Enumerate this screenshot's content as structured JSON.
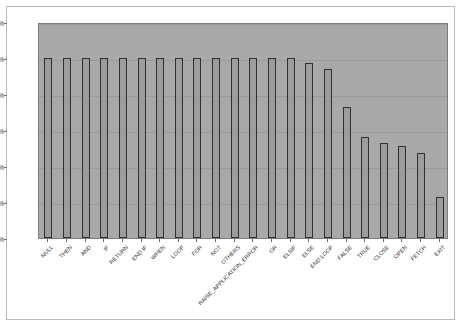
{
  "chart_data": {
    "type": "bar",
    "title": "",
    "subtitle": "",
    "xlabel": "",
    "ylabel": "",
    "ylim": [
      0,
      120
    ],
    "y_unit": "%",
    "grid": true,
    "legend": "none",
    "orientation": "vertical",
    "categories": [
      "NULL",
      "THEN",
      "AND",
      "IF",
      "RETURN",
      "END IF",
      "WHEN",
      "LOOP",
      "FOR",
      "NOT",
      "OTHERS",
      "RAISE_APPLICATION_ERROR",
      "OR",
      "ELSIF",
      "ELSE",
      "END LOOP",
      "FALSE",
      "TRUE",
      "CLOSE",
      "OPEN",
      "FETCH",
      "EXIT"
    ],
    "values": [
      100,
      100,
      100,
      100,
      100,
      100,
      100,
      100,
      100,
      100,
      100,
      100,
      100,
      100,
      97,
      94,
      73,
      56,
      53,
      51,
      47,
      23
    ],
    "yticks": [
      0,
      20,
      40,
      60,
      80,
      100,
      120
    ],
    "ytick_labels": [
      "0%",
      "20%",
      "40%",
      "60%",
      "80%",
      "100%",
      "120%"
    ],
    "colors": {
      "plot_background": "#a9a9a9",
      "bar_fill": "#9c9c9c",
      "bar_border": "#2f2f2f",
      "gridline": "#9a9a9a",
      "axis_text": "#2b2b2b",
      "frame_border": "#b9b9b9"
    }
  }
}
